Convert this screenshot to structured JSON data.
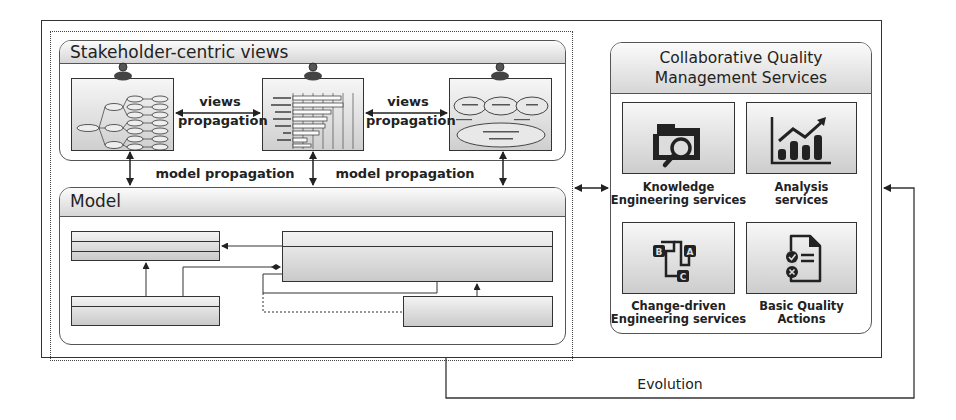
{
  "stakeholder_views": {
    "title": "Stakeholder-centric views",
    "views": [
      {
        "name": "tree-view",
        "icon": "stakeholder-avatar-icon"
      },
      {
        "name": "timeline-chart-view",
        "icon": "stakeholder-avatar-icon"
      },
      {
        "name": "model-composition-view",
        "icon": "stakeholder-avatar-icon"
      }
    ],
    "views_propagation_1": {
      "line1": "views",
      "line2": "propagation"
    },
    "views_propagation_2": {
      "line1": "views",
      "line2": "propagation"
    }
  },
  "model_propagation": [
    "model propagation",
    "model propagation"
  ],
  "model": {
    "title": "Model"
  },
  "services": {
    "title_line1": "Collaborative Quality",
    "title_line2": "Management Services",
    "items": [
      {
        "icon": "folder-search-icon",
        "line1": "Knowledge",
        "line2": "Engineering services"
      },
      {
        "icon": "chart-growth-icon",
        "line1": "Analysis",
        "line2": "services"
      },
      {
        "icon": "abc-flow-icon",
        "line1": "Change-driven",
        "line2": "Engineering services"
      },
      {
        "icon": "checklist-document-icon",
        "line1": "Basic Quality",
        "line2": "Actions"
      }
    ]
  },
  "evolution": {
    "label": "Evolution"
  },
  "colors": {
    "stroke": "#333333",
    "panel_header_top": "#fbfbfb",
    "panel_header_bottom": "#d6d6d6"
  }
}
